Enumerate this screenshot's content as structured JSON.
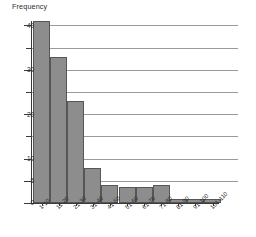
{
  "chart_data": {
    "type": "bar",
    "title": "Frequency",
    "xlabel": "",
    "ylabel": "Frequency",
    "categories": [
      "1-10",
      "11-20",
      "21-30",
      "31-40",
      "41-50",
      "51-60",
      "61-70",
      "71-80",
      "81-90",
      "91-100",
      "101-110"
    ],
    "values": [
      41,
      33,
      23,
      8,
      4,
      3.5,
      3.5,
      4,
      1,
      1,
      1
    ],
    "ylim": [
      0,
      41
    ],
    "y_major_ticks": [
      0,
      5,
      10,
      20,
      30,
      40
    ],
    "y_minor_ticks": [
      15,
      25,
      35
    ],
    "y_tick_labels": [
      "0",
      "5",
      "10",
      "20",
      "30",
      "40"
    ],
    "gridlines": true,
    "grid_axis": "y",
    "legend": "none",
    "bar_fill_color": "#8d8d8d",
    "bar_border_color": "#565656",
    "gridline_color": "#9a9a9a",
    "axis_color": "#3a3a3a",
    "background_color": "#ffffff"
  },
  "axis": {
    "y_labels": [
      "40",
      "30",
      "20",
      "10",
      "5",
      "0"
    ]
  }
}
